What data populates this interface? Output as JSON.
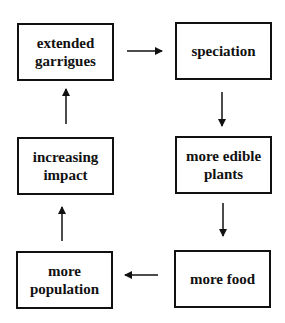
{
  "diagram": {
    "type": "cycle-flowchart",
    "nodes": [
      {
        "id": "n1",
        "lines": [
          "extended",
          "garrigues"
        ]
      },
      {
        "id": "n2",
        "lines": [
          "speciation"
        ]
      },
      {
        "id": "n3",
        "lines": [
          "more edible",
          "plants"
        ]
      },
      {
        "id": "n4",
        "lines": [
          "more food"
        ]
      },
      {
        "id": "n5",
        "lines": [
          "more",
          "population"
        ]
      },
      {
        "id": "n6",
        "lines": [
          "increasing",
          "impact"
        ]
      }
    ],
    "edges": [
      {
        "from": "extended garrigues",
        "to": "speciation"
      },
      {
        "from": "speciation",
        "to": "more edible plants"
      },
      {
        "from": "more edible plants",
        "to": "more food"
      },
      {
        "from": "more food",
        "to": "more population"
      },
      {
        "from": "more population",
        "to": "increasing impact"
      },
      {
        "from": "increasing impact",
        "to": "extended garrigues"
      }
    ]
  }
}
